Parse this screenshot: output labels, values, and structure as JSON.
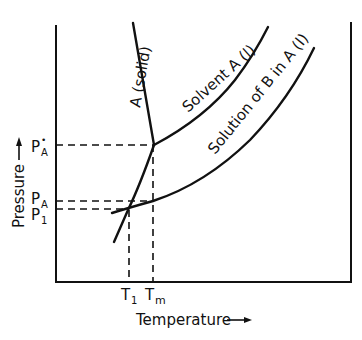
{
  "diagram": {
    "axes": {
      "x_label": "Temperature",
      "y_label": "Pressure",
      "x_arrow": "right-arrow",
      "y_arrow": "up-arrow"
    },
    "curves": {
      "solid": {
        "label": "A (solid)"
      },
      "solvent": {
        "label": "Solvent A (l)"
      },
      "solution": {
        "label": "Solution of B in A (l)"
      }
    },
    "y_ticks": {
      "pa_star": {
        "main": "P",
        "sub": "A",
        "sup": "•"
      },
      "pa": {
        "main": "P",
        "sub": "A"
      },
      "p1": {
        "main": "P",
        "sub": "1"
      }
    },
    "x_ticks": {
      "t1": {
        "main": "T",
        "sub": "1"
      },
      "tm": {
        "main": "T",
        "sub": "m"
      }
    },
    "colors": {
      "line": "#111111",
      "background": "#ffffff"
    }
  }
}
